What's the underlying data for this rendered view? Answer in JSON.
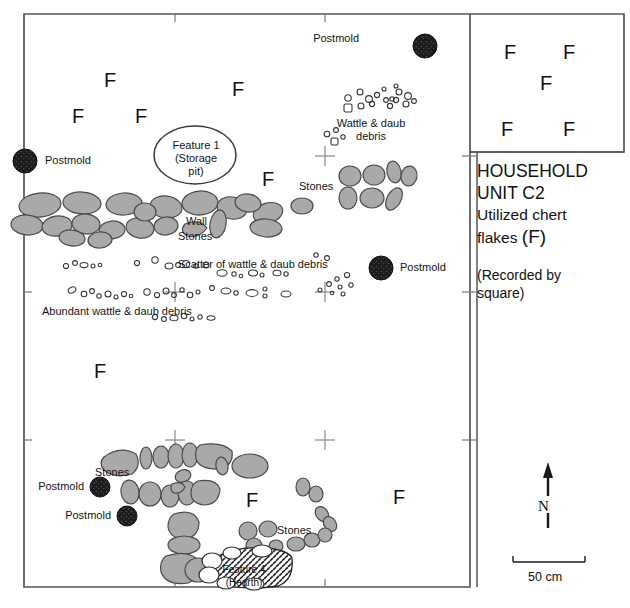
{
  "legend": {
    "title_line1": "HOUSEHOLD",
    "title_line2": "UNIT C2",
    "subtitle_line1": "Utilized chert",
    "subtitle_line2_pre": "flakes ",
    "subtitle_line2_sym": "(F)",
    "note_line1": "(Recorded by",
    "note_line2": "square)"
  },
  "compass": {
    "label": "N"
  },
  "scale": {
    "label": "50 cm"
  },
  "map_labels": {
    "postmold": "Postmold",
    "wattle_daub_debris_l1": "Wattle & daub",
    "wattle_daub_debris_l2": "debris",
    "feature1_l1": "Feature 1",
    "feature1_l2": "(Storage",
    "feature1_l3": "pit)",
    "stones": "Stones",
    "wall_stones_l1": "Wall",
    "wall_stones_l2": "Stones",
    "scatter": "Scatter of wattle & daub debris",
    "abundant": "Abundant wattle & daub debris",
    "feature4_l1": "Feature 4",
    "feature4_l2": "(Hearth)"
  },
  "flake_marker": "F",
  "colors": {
    "stone_fill": "#a9a9a9",
    "stone_stroke": "#4a4a4a",
    "postmold_fill": "#1c1c1c",
    "frame_stroke": "#555555",
    "debris_stroke": "#333333",
    "text": "#141414"
  },
  "chert_flakes": {
    "legend_box_count": 5,
    "map_count": 8,
    "legend_box_positions": [
      {
        "x": 504,
        "y": 42
      },
      {
        "x": 563,
        "y": 42
      },
      {
        "x": 540,
        "y": 73
      },
      {
        "x": 501,
        "y": 119
      },
      {
        "x": 563,
        "y": 119
      }
    ],
    "map_positions": [
      {
        "x": 104,
        "y": 70
      },
      {
        "x": 232,
        "y": 79
      },
      {
        "x": 72,
        "y": 106
      },
      {
        "x": 135,
        "y": 106
      },
      {
        "x": 262,
        "y": 169
      },
      {
        "x": 94,
        "y": 361
      },
      {
        "x": 246,
        "y": 490
      },
      {
        "x": 393,
        "y": 487
      }
    ]
  },
  "postmolds": [
    {
      "name": "postmold-top",
      "cx": 425,
      "cy": 46,
      "r": 12,
      "label_x": 359,
      "label_y": 38,
      "label_align": "right"
    },
    {
      "name": "postmold-left-edge",
      "cx": 25,
      "cy": 161,
      "r": 12,
      "label_x": 45,
      "label_y": 154,
      "label_align": "left"
    },
    {
      "name": "postmold-mid-right",
      "cx": 381,
      "cy": 268,
      "r": 12,
      "label_x": 401,
      "label_y": 261,
      "label_align": "left"
    },
    {
      "name": "postmold-lower-a",
      "cx": 100,
      "cy": 487,
      "r": 10,
      "label_x": 27,
      "label_y": 480,
      "label_align": "right"
    },
    {
      "name": "postmold-lower-b",
      "cx": 127,
      "cy": 516,
      "r": 10,
      "label_x": 54,
      "label_y": 509,
      "label_align": "right"
    }
  ],
  "grid_crosses": [
    {
      "x": 175,
      "y": 292
    },
    {
      "x": 325,
      "y": 156
    },
    {
      "x": 325,
      "y": 292
    },
    {
      "x": 325,
      "y": 440
    },
    {
      "x": 175,
      "y": 440
    },
    {
      "x": 175,
      "y": 156
    }
  ]
}
